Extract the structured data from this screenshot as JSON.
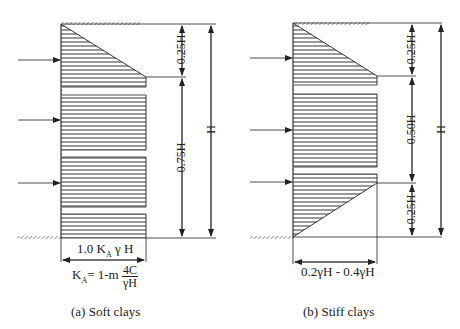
{
  "figure": {
    "panels": [
      {
        "id": "a",
        "caption": "(a) Soft clays",
        "dimensions": {
          "top_segment": "0.25H",
          "bottom_segment": "0.75H",
          "total": "H"
        },
        "width_label": {
          "prefix": "1.0 K",
          "sub": "A",
          "suffix": " γ H"
        },
        "formula": {
          "lhs_main": "K",
          "lhs_sub": "A",
          "rhs": "= 1-m ",
          "numerator": "4C",
          "denominator": "γH"
        }
      },
      {
        "id": "b",
        "caption": "(b) Stiff clays",
        "dimensions": {
          "top_segment": "0.25H",
          "middle_segment": "0.50H",
          "bottom_segment": "0.25H",
          "total": "H"
        },
        "width_label": "0.2γH - 0.4γH"
      }
    ]
  }
}
